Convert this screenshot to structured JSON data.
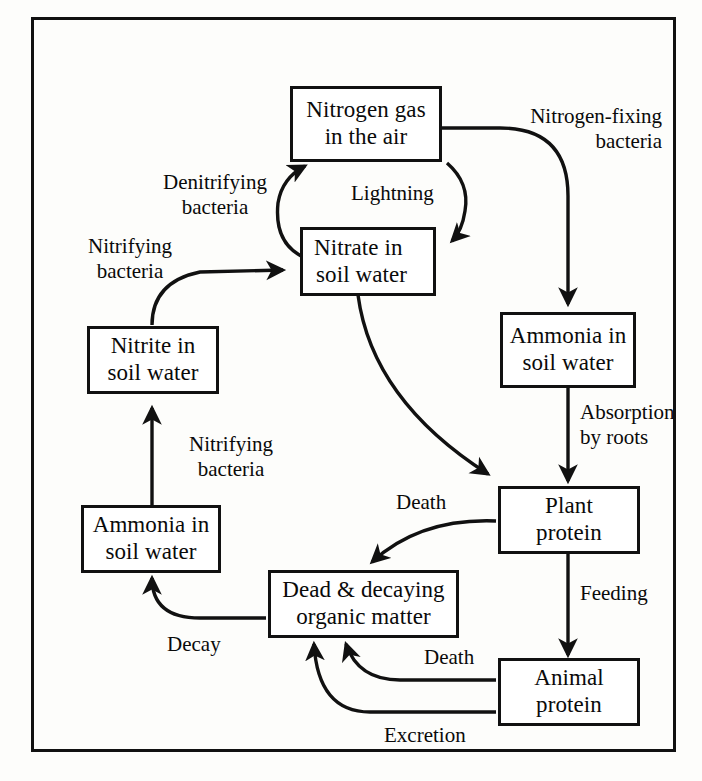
{
  "diagram": {
    "frame_color": "#111111",
    "background_color": "#fdfdfb",
    "node_fill": "#ffffff",
    "text_color": "#0a0a0a"
  },
  "nodes": [
    {
      "id": "nitrogen-gas",
      "line1": "Nitrogen gas",
      "line2": "in the air"
    },
    {
      "id": "nitrate",
      "line1": "Nitrate in",
      "line2": "soil water"
    },
    {
      "id": "ammonia-upper",
      "line1": "Ammonia in",
      "line2": "soil water"
    },
    {
      "id": "nitrite",
      "line1": "Nitrite in",
      "line2": "soil water"
    },
    {
      "id": "ammonia-lower",
      "line1": "Ammonia in",
      "line2": "soil water"
    },
    {
      "id": "plant-protein",
      "line1": "Plant",
      "line2": "protein"
    },
    {
      "id": "dead-matter",
      "line1": "Dead & decaying",
      "line2": "organic matter"
    },
    {
      "id": "animal-protein",
      "line1": "Animal",
      "line2": "protein"
    }
  ],
  "edge_labels": [
    {
      "id": "nitrogen-fixing",
      "line1": "Nitrogen-fixing",
      "line2": "bacteria"
    },
    {
      "id": "denitrifying",
      "line1": "Denitrifying",
      "line2": "bacteria"
    },
    {
      "id": "lightning",
      "line1": "Lightning",
      "line2": ""
    },
    {
      "id": "nitrifying-upper",
      "line1": "Nitrifying",
      "line2": "bacteria"
    },
    {
      "id": "nitrifying-lower",
      "line1": "Nitrifying",
      "line2": "bacteria"
    },
    {
      "id": "absorption",
      "line1": "Absorption",
      "line2": "by roots"
    },
    {
      "id": "death-plant",
      "line1": "Death",
      "line2": ""
    },
    {
      "id": "feeding",
      "line1": "Feeding",
      "line2": ""
    },
    {
      "id": "death-animal",
      "line1": "Death",
      "line2": ""
    },
    {
      "id": "excretion",
      "line1": "Excretion",
      "line2": ""
    },
    {
      "id": "decay",
      "line1": "Decay",
      "line2": ""
    }
  ]
}
